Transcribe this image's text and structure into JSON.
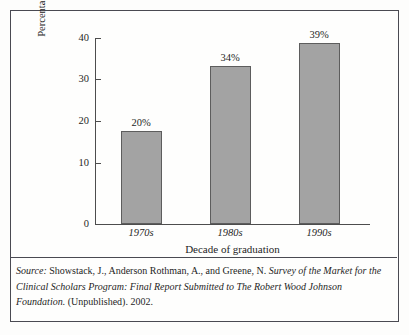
{
  "figure": {
    "source_label": "Source:",
    "source_authors": "Showstack, J., Anderson Rothman, A., and Greene, N.",
    "source_title": "Survey of the Market for the Clinical Scholars Program: Final Report Submitted to The Robert Wood Johnson Foundation.",
    "source_publication": "(Unpublished). 2002."
  },
  "chart_data": {
    "type": "bar",
    "title": "",
    "categories": [
      "1970s",
      "1980s",
      "1990s"
    ],
    "values": [
      20,
      34,
      39
    ],
    "data_labels": [
      "20%",
      "34%",
      "39%"
    ],
    "xlabel": "Decade of graduation",
    "ylabel": "Percentage of scholars not satisfied with advancement",
    "ylim": [
      0,
      40
    ],
    "yticks": [
      0,
      10,
      20,
      30,
      40
    ],
    "ytick_labels": [
      "0",
      "10",
      "20",
      "30",
      "40"
    ],
    "grid": false,
    "legend": false,
    "bar_color": "#a3a3a3",
    "bar_edge_color": "#5d5d5d",
    "axis_color": "#4d4d4d"
  }
}
